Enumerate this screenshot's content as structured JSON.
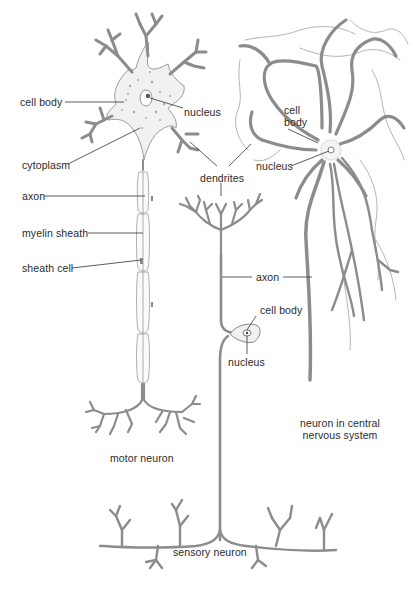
{
  "figure": {
    "labels": {
      "motor_cell_body": "cell body",
      "motor_nucleus": "nucleus",
      "cytoplasm": "cytoplasm",
      "dendrites": "dendrites",
      "axon_motor": "axon",
      "myelin_sheath": "myelin sheath",
      "sheath_cell": "sheath cell",
      "cns_cell_body_line1": "cell",
      "cns_cell_body_line2": "body",
      "cns_nucleus": "nucleus",
      "axon_shared": "axon",
      "sensory_cell_body": "cell body",
      "sensory_nucleus": "nucleus",
      "cns_caption_line1": "neuron in central",
      "cns_caption_line2": "nervous system",
      "motor_caption": "motor neuron",
      "sensory_caption": "sensory neuron"
    },
    "neurons": [
      {
        "name": "motor neuron",
        "parts": [
          "cell body",
          "nucleus",
          "cytoplasm",
          "dendrites",
          "axon",
          "myelin sheath",
          "sheath cell"
        ]
      },
      {
        "name": "neuron in central nervous system",
        "parts": [
          "cell body",
          "nucleus",
          "dendrites",
          "axon"
        ]
      },
      {
        "name": "sensory neuron",
        "parts": [
          "dendrites",
          "axon",
          "cell body",
          "nucleus"
        ]
      }
    ],
    "colors": {
      "line": "#8c8c8c",
      "text": "#2a2a2a",
      "background": "#ffffff"
    }
  }
}
